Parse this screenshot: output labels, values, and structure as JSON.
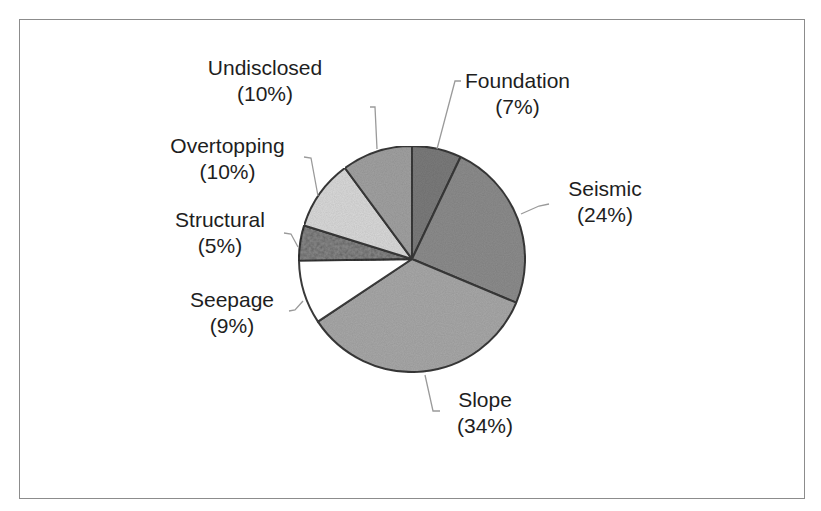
{
  "chart_data": {
    "type": "pie",
    "title": "",
    "start_angle_deg": 0,
    "direction": "clockwise",
    "center": [
      412,
      259
    ],
    "radius": 113,
    "slices": [
      {
        "name": "Foundation",
        "value": 7,
        "label": "(7%)",
        "color": "#7b7b7b",
        "pattern": "speckle"
      },
      {
        "name": "Seismic",
        "value": 24,
        "label": "(24%)",
        "color": "#8d8d8d",
        "pattern": "speckle"
      },
      {
        "name": "Slope",
        "value": 34,
        "label": "(34%)",
        "color": "#a9a9a9",
        "pattern": "speckle"
      },
      {
        "name": "Seepage",
        "value": 9,
        "label": "(9%)",
        "color": "#ffffff",
        "pattern": "none"
      },
      {
        "name": "Structural",
        "value": 5,
        "label": "(5%)",
        "color": "#8a8a8a",
        "pattern": "coarse"
      },
      {
        "name": "Overtopping",
        "value": 10,
        "label": "(10%)",
        "color": "#dadada",
        "pattern": "light-speckle"
      },
      {
        "name": "Undisclosed",
        "value": 10,
        "label": "(10%)",
        "color": "#a2a2a2",
        "pattern": "speckle"
      }
    ],
    "legend": "none (data labels with leader lines)"
  },
  "labels": {
    "foundation": {
      "name": "Foundation",
      "pct": "(7%)"
    },
    "seismic": {
      "name": "Seismic",
      "pct": "(24%)"
    },
    "slope": {
      "name": "Slope",
      "pct": "(34%)"
    },
    "seepage": {
      "name": "Seepage",
      "pct": "(9%)"
    },
    "structural": {
      "name": "Structural",
      "pct": "(5%)"
    },
    "overtopping": {
      "name": "Overtopping",
      "pct": "(10%)"
    },
    "undisclosed": {
      "name": "Undisclosed",
      "pct": "(10%)"
    }
  },
  "colors": {
    "frame_border": "#8c8c8c",
    "slice_outline": "#3a3a3a",
    "leader_line": "#9a9a9a",
    "text": "#1e1e1e"
  }
}
